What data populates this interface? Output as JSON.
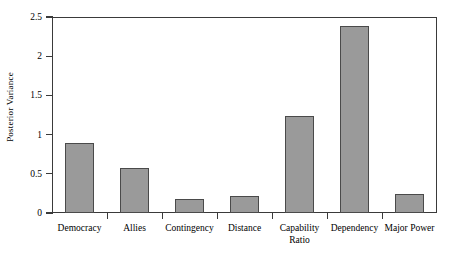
{
  "chart_data": {
    "type": "bar",
    "title": "",
    "xlabel": "",
    "ylabel": "Posterior Variance",
    "categories": [
      "Democracy",
      "Allies",
      "Contingency",
      "Distance",
      "Capability\nRatio",
      "Dependency",
      "Major Power"
    ],
    "values": [
      0.89,
      0.57,
      0.18,
      0.22,
      1.24,
      2.39,
      0.24
    ],
    "ylim": [
      0,
      2.5
    ],
    "yticks": [
      0,
      0.5,
      1,
      1.5,
      2,
      2.5
    ],
    "ytick_labels": [
      "0",
      "0.5",
      "1",
      "1.5",
      "2",
      "2.5"
    ],
    "grid": false,
    "legend": false,
    "bar_color": "#9a9a9a",
    "bar_edge_color": "#4a4a4a",
    "axis_color": "#3a3a3a",
    "background": "#ffffff"
  }
}
